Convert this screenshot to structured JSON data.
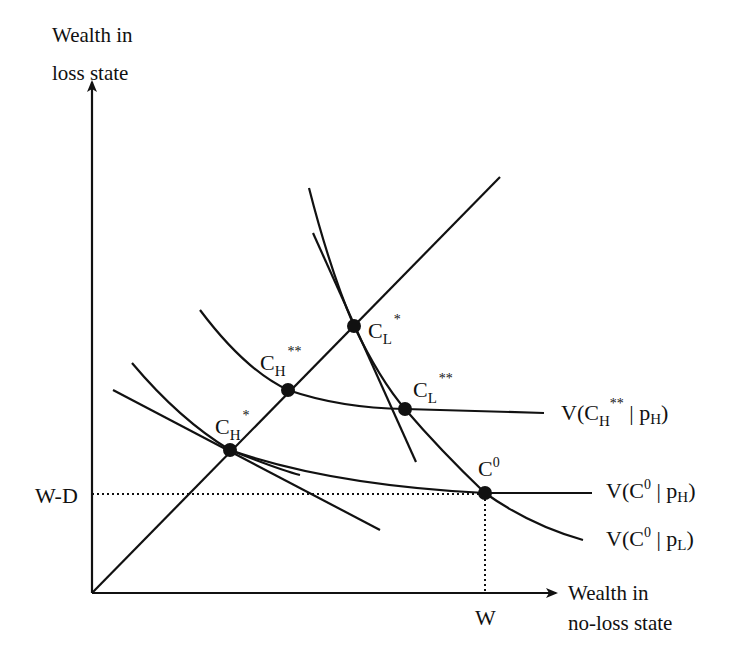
{
  "diagram": {
    "type": "insurance-indifference-curves",
    "colors": {
      "ink": "#111111",
      "background": "#ffffff"
    },
    "axes": {
      "y_label_line1": "Wealth in",
      "y_label_line2": "loss state",
      "x_label_line1": "Wealth in",
      "x_label_line2": "no-loss state",
      "y_tick": "W-D",
      "x_tick": "W"
    },
    "points": {
      "c0": {
        "base": "C",
        "sup": "0"
      },
      "ch_star": {
        "base": "C",
        "sub": "H",
        "sup": "*"
      },
      "ch_double_star": {
        "base": "C",
        "sub": "H",
        "sup": "**"
      },
      "cl_star": {
        "base": "C",
        "sub": "L",
        "sup": "*"
      },
      "cl_double_star": {
        "base": "C",
        "sub": "L",
        "sup": "**"
      }
    },
    "curve_labels": {
      "v_ch2_ph": {
        "open": "V(C",
        "sub1": "H",
        "sup1": "**",
        "mid": " | p",
        "sub2": "H",
        "close": ")"
      },
      "v_c0_ph": {
        "open": "V(C",
        "sup1": "0",
        "mid": " | p",
        "sub2": "H",
        "close": ")"
      },
      "v_c0_pl": {
        "open": "V(C",
        "sup1": "0",
        "mid": " | p",
        "sub2": "L",
        "close": ")"
      }
    }
  }
}
